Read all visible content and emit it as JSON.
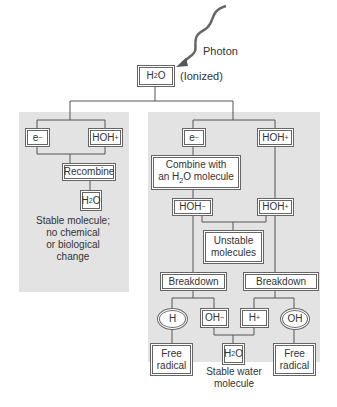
{
  "photon": {
    "label": "Photon"
  },
  "root": {
    "label_main": "H",
    "label_sub": "2",
    "label_end": "O",
    "note": "(Ionized)"
  },
  "left_branch": {
    "electron": {
      "main": "e",
      "sup": "−"
    },
    "hoh_plus": {
      "main": "HOH",
      "sup": "+"
    },
    "recombine": "Recombine",
    "water": {
      "main": "H",
      "sub": "2",
      "end": "O"
    },
    "caption": [
      "Stable molecule;",
      "no chemical",
      "or biological",
      "change"
    ]
  },
  "right_branch": {
    "electron": {
      "main": "e",
      "sup": "−"
    },
    "hoh_plus_top": {
      "main": "HOH",
      "sup": "+"
    },
    "combine": {
      "line1": "Combine with",
      "line2_pre": "an H",
      "line2_sub": "2",
      "line2_post": "O molecule"
    },
    "hoh_minus": {
      "main": "HOH",
      "sup": "−"
    },
    "hoh_plus_mid": {
      "main": "HOH",
      "sup": "+"
    },
    "unstable": [
      "Unstable",
      "molecules"
    ],
    "breakdown_left": "Breakdown",
    "breakdown_right": "Breakdown",
    "h_radical": "H",
    "oh_minus": {
      "main": "OH",
      "sup": "−"
    },
    "h_plus": {
      "main": "H",
      "sup": "+"
    },
    "oh_radical": "OH",
    "free_radical_left": [
      "Free",
      "radical"
    ],
    "water": {
      "main": "H",
      "sub": "2",
      "end": "O"
    },
    "free_radical_right": [
      "Free",
      "radical"
    ],
    "caption": [
      "Stable water",
      "molecule"
    ]
  },
  "colors": {
    "panel": "#e3e3e3",
    "line": "#555555",
    "border": "#666666"
  }
}
